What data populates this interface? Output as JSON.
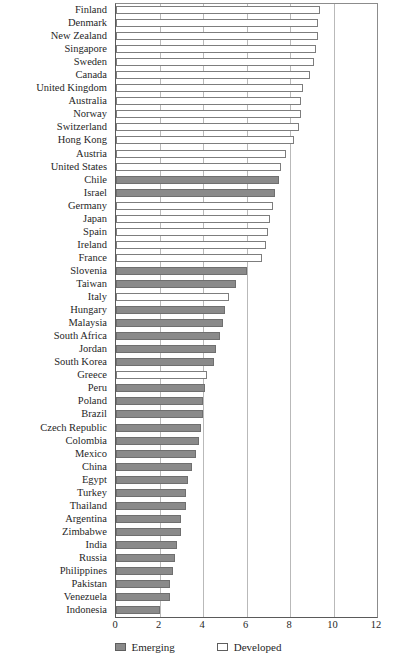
{
  "chart_data": {
    "type": "bar",
    "orientation": "horizontal",
    "title": "",
    "subtitle": "",
    "xlabel": "",
    "ylabel": "",
    "xlim": [
      0,
      12
    ],
    "xticks": [
      0,
      2,
      4,
      6,
      8,
      10,
      12
    ],
    "grid": true,
    "legend_position": "bottom",
    "legend": [
      {
        "name": "Emerging",
        "color": "#8a8a8a"
      },
      {
        "name": "Developed",
        "color": "#ffffff"
      }
    ],
    "categories": [
      "Finland",
      "Denmark",
      "New Zealand",
      "Singapore",
      "Sweden",
      "Canada",
      "United Kingdom",
      "Australia",
      "Norway",
      "Switzerland",
      "Hong Kong",
      "Austria",
      "United States",
      "Chile",
      "Israel",
      "Germany",
      "Japan",
      "Spain",
      "Ireland",
      "France",
      "Slovenia",
      "Taiwan",
      "Italy",
      "Hungary",
      "Malaysia",
      "South Africa",
      "Jordan",
      "South Korea",
      "Greece",
      "Peru",
      "Poland",
      "Brazil",
      "Czech Republic",
      "Colombia",
      "Mexico",
      "China",
      "Egypt",
      "Turkey",
      "Thailand",
      "Argentina",
      "Zimbabwe",
      "India",
      "Russia",
      "Philippines",
      "Pakistan",
      "Venezuela",
      "Indonesia"
    ],
    "values": [
      9.4,
      9.3,
      9.3,
      9.2,
      9.1,
      8.9,
      8.6,
      8.5,
      8.5,
      8.4,
      8.2,
      7.8,
      7.6,
      7.5,
      7.3,
      7.2,
      7.1,
      7.0,
      6.9,
      6.7,
      6.0,
      5.5,
      5.2,
      5.0,
      4.9,
      4.8,
      4.6,
      4.5,
      4.2,
      4.1,
      4.0,
      4.0,
      3.9,
      3.8,
      3.7,
      3.5,
      3.3,
      3.2,
      3.2,
      3.0,
      3.0,
      2.8,
      2.7,
      2.6,
      2.5,
      2.5,
      2.0
    ],
    "groups": [
      "Developed",
      "Developed",
      "Developed",
      "Developed",
      "Developed",
      "Developed",
      "Developed",
      "Developed",
      "Developed",
      "Developed",
      "Developed",
      "Developed",
      "Developed",
      "Emerging",
      "Emerging",
      "Developed",
      "Developed",
      "Developed",
      "Developed",
      "Developed",
      "Emerging",
      "Emerging",
      "Developed",
      "Emerging",
      "Emerging",
      "Emerging",
      "Emerging",
      "Emerging",
      "Developed",
      "Emerging",
      "Emerging",
      "Emerging",
      "Emerging",
      "Emerging",
      "Emerging",
      "Emerging",
      "Emerging",
      "Emerging",
      "Emerging",
      "Emerging",
      "Emerging",
      "Emerging",
      "Emerging",
      "Emerging",
      "Emerging",
      "Emerging",
      "Emerging"
    ]
  }
}
